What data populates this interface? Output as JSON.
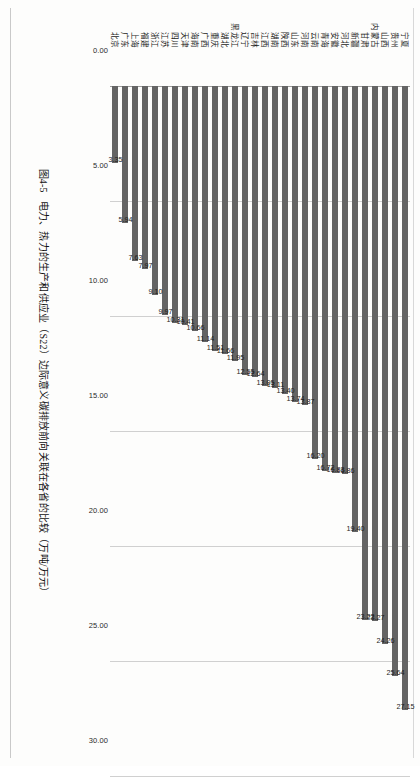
{
  "figure": {
    "caption_number": "图4-5",
    "caption_text": "电力、热力的生产和供应业（S22）边际意义碳排放前向关联在各省的比较（万吨/万元）"
  },
  "chart_data": {
    "type": "bar",
    "title": "电力、热力的生产和供应业（S22）边际意义碳排放前向关联在各省的比较（万吨/万元）",
    "orientation": "vertical-on-page-rotated",
    "xlabel": "",
    "ylabel": "",
    "ylim": [
      0,
      30
    ],
    "grid": true,
    "legend": "none",
    "ticks": [
      "0.00",
      "5.00",
      "10.00",
      "15.00",
      "20.00",
      "25.00",
      "30.00"
    ],
    "tick_values": [
      0,
      5,
      10,
      15,
      20,
      25,
      30
    ],
    "categories": [
      "宁夏",
      "贵州",
      "山西",
      "内蒙古",
      "甘肃",
      "新疆",
      "河北",
      "安徽",
      "青海",
      "云南",
      "河南",
      "山东",
      "陕西",
      "湖南",
      "江西",
      "吉林",
      "辽宁",
      "黑龙江",
      "湖北",
      "重庆",
      "广西",
      "海南",
      "天津",
      "四川",
      "江苏",
      "浙江",
      "福建",
      "上海",
      "广东",
      "北京"
    ],
    "values": [
      27.15,
      25.64,
      24.26,
      23.27,
      23.22,
      19.4,
      16.86,
      16.83,
      16.72,
      16.2,
      13.87,
      13.74,
      13.4,
      13.11,
      13.05,
      12.64,
      12.55,
      11.95,
      11.66,
      11.51,
      11.14,
      10.66,
      10.41,
      10.31,
      9.97,
      9.1,
      7.97,
      7.63,
      5.94,
      3.35
    ],
    "value_labels": [
      "27.15",
      "25.64",
      "24.26",
      "23.27",
      "23.22",
      "19.40",
      "16.86",
      "16.83",
      "16.72",
      "16.20",
      "13.87",
      "13.74",
      "13.40",
      "13.11",
      "13.05",
      "12.64",
      "12.55",
      "11.95",
      "11.66",
      "11.51",
      "11.14",
      "10.66",
      "10.41",
      "10.31",
      "9.97",
      "9.10",
      "7.97",
      "7.63",
      "5.94",
      "3.35"
    ],
    "bar_color": "#646464",
    "grid_color": "#d0d0d0"
  }
}
